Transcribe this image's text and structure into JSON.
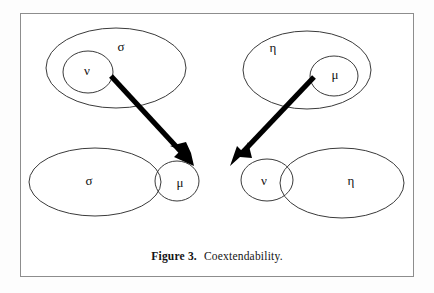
{
  "figure": {
    "caption_label": "Figure 3.",
    "caption_text": "Coextendability.",
    "frame_color": "#8d8d8d",
    "background_color": "#ffffff",
    "ellipse_stroke_color": "#3a3a3a",
    "arrow_color": "#000000"
  },
  "groups": {
    "top_left": {
      "outer_label": "σ",
      "inner_label": "ν"
    },
    "top_right": {
      "outer_label": "η",
      "inner_label": "μ"
    },
    "bottom_left": {
      "outer_label": "σ",
      "inner_label": "μ"
    },
    "bottom_right": {
      "outer_label": "η",
      "inner_label": "ν"
    }
  },
  "arrows": [
    {
      "name": "nu-to-mu-arrow",
      "from_label": "ν",
      "to_label": "μ"
    },
    {
      "name": "mu-to-nu-arrow",
      "from_label": "μ",
      "to_label": "ν"
    }
  ]
}
